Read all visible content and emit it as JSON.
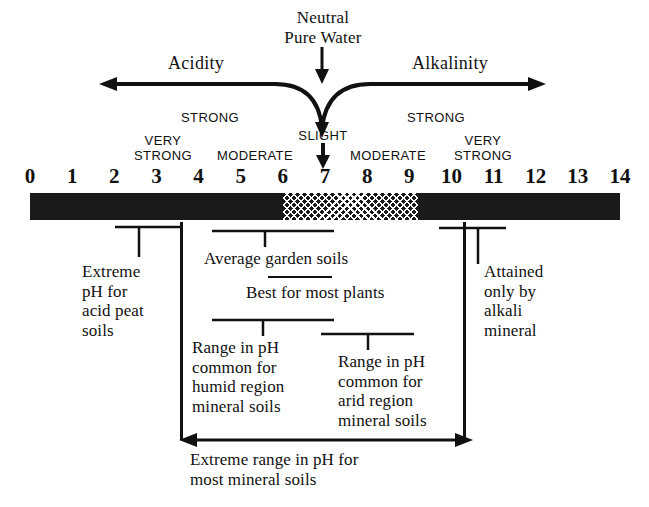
{
  "top": {
    "neutral_line1": "Neutral",
    "neutral_line2": "Pure Water",
    "acidity_label": "Acidity",
    "alkalinity_label": "Alkalinity"
  },
  "strength_labels": {
    "acid_strong": "STRONG",
    "acid_very_strong_l1": "VERY",
    "acid_very_strong_l2": "STRONG",
    "acid_moderate": "MODERATE",
    "slight": "SLIGHT",
    "alk_moderate": "MODERATE",
    "alk_strong": "STRONG",
    "alk_very_strong_l1": "VERY",
    "alk_very_strong_l2": "STRONG"
  },
  "scale": {
    "ticks": [
      "0",
      "1",
      "2",
      "3",
      "4",
      "5",
      "6",
      "7",
      "8",
      "9",
      "10",
      "11",
      "12",
      "13",
      "14"
    ],
    "bar_color": "#1a1a1a",
    "hatch_start_ph": "6",
    "hatch_end_ph": "9.2"
  },
  "annotations": {
    "acid_peat": {
      "line1": "Extreme",
      "line2": "pH for",
      "line3": "acid peat",
      "line4": "soils"
    },
    "average_garden": {
      "text": "Average garden soils"
    },
    "best_plants": {
      "text": "Best for most plants"
    },
    "humid": {
      "line1": "Range in pH",
      "line2": "common for",
      "line3": "humid region",
      "line4": "mineral soils"
    },
    "arid": {
      "line1": "Range in pH",
      "line2": "common for",
      "line3": "arid region",
      "line4": "mineral soils"
    },
    "alkali": {
      "line1": "Attained",
      "line2": "only by",
      "line3": "alkali",
      "line4": "mineral"
    },
    "extreme_range": {
      "line1": "Extreme range in pH for",
      "line2": "most mineral soils"
    }
  },
  "chart_data": {
    "type": "bar",
    "xlabel": "pH",
    "ylabel": "",
    "xlim": [
      0,
      14
    ],
    "grid": false,
    "legend": "none",
    "categories": [
      "0",
      "1",
      "2",
      "3",
      "4",
      "5",
      "6",
      "7",
      "8",
      "9",
      "10",
      "11",
      "12",
      "13",
      "14"
    ],
    "values": [
      0,
      0,
      0,
      0,
      0,
      0,
      0,
      0,
      0,
      0,
      0,
      0,
      0,
      0,
      0
    ],
    "neutral_point": 7,
    "acidity_range": [
      0,
      7
    ],
    "alkalinity_range": [
      7,
      14
    ],
    "hatched_band": [
      6,
      9.2
    ],
    "strength_zones": [
      {
        "label": "VERY STRONG",
        "side": "acid",
        "approx_ph": 3.2
      },
      {
        "label": "STRONG",
        "side": "acid",
        "approx_ph": 4.3
      },
      {
        "label": "MODERATE",
        "side": "acid",
        "approx_ph": 5.5
      },
      {
        "label": "SLIGHT",
        "side": "neutral",
        "approx_ph": 7.0
      },
      {
        "label": "MODERATE",
        "side": "alkaline",
        "approx_ph": 8.5
      },
      {
        "label": "STRONG",
        "side": "alkaline",
        "approx_ph": 9.7
      },
      {
        "label": "VERY STRONG",
        "side": "alkaline",
        "approx_ph": 10.6
      }
    ],
    "ranges": [
      {
        "name": "Extreme pH for acid peat soils",
        "ph_from": 2.3,
        "ph_to": 3.3,
        "marker_ph": 3.0
      },
      {
        "name": "Average garden soils",
        "ph_from": 4.4,
        "ph_to": 7.2,
        "marker_ph": 5.6
      },
      {
        "name": "Best for most plants",
        "ph_from": 5.7,
        "ph_to": 7.2,
        "marker_ph": 6.4
      },
      {
        "name": "Range in pH common for humid region mineral soils",
        "ph_from": 4.4,
        "ph_to": 7.2,
        "marker_ph": 5.6
      },
      {
        "name": "Range in pH common for arid region mineral soils",
        "ph_from": 7.0,
        "ph_to": 9.2,
        "marker_ph": 8.1
      },
      {
        "name": "Attained only by alkali mineral",
        "ph_from": 9.8,
        "ph_to": 11.3,
        "marker_ph": 10.4
      },
      {
        "name": "Extreme range in pH for most mineral soils",
        "ph_from": 4.0,
        "ph_to": 10.4,
        "marker_ph": null
      }
    ]
  }
}
